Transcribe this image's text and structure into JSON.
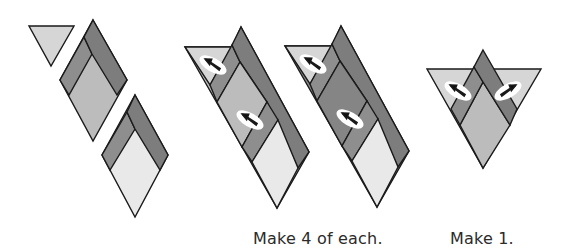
{
  "colors": {
    "stroke": "#1a1a1a",
    "light": "#d6d6d6",
    "very_light": "#e9e9e9",
    "medium": "#bcbcbc",
    "dark": "#8e8e8e",
    "darker": "#7a7a7a",
    "seam_ellipse": "#ffffff"
  },
  "labels": {
    "make_each": "Make 4 of each.",
    "make_one": "Make 1."
  },
  "figures": [
    {
      "id": "loose-triangle-and-diamonds",
      "description": "Light triangle plus two chevron-diamond units"
    },
    {
      "id": "strip-unit-medium",
      "description": "Assembled strip with medium gray upper diamond",
      "pressing_arrows": 2
    },
    {
      "id": "strip-unit-dark",
      "description": "Assembled strip with dark gray upper diamond",
      "pressing_arrows": 2
    },
    {
      "id": "triangle-unit",
      "description": "Chevron diamond set into light triangle",
      "pressing_arrows": 2
    }
  ]
}
